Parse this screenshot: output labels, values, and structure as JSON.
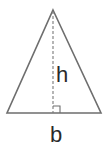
{
  "diagram": {
    "type": "triangle-area",
    "labels": {
      "height": "h",
      "base": "b"
    },
    "geometry": {
      "apex": [
        53,
        10
      ],
      "base_left": [
        7,
        113
      ],
      "base_right": [
        101,
        113
      ],
      "altitude_foot": [
        53,
        113
      ]
    },
    "colors": {
      "stroke": "#6e6e6e",
      "text": "#2a2a2a",
      "background": "#ffffff"
    },
    "annotations": [
      "right-angle-marker",
      "dashed-altitude"
    ]
  }
}
